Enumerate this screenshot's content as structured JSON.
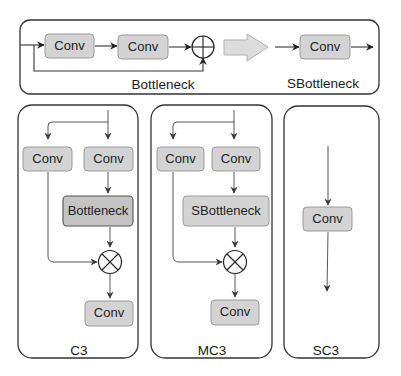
{
  "diagram": {
    "top_panel": {
      "bottleneck": {
        "label": "Bottleneck",
        "conv1": "Conv",
        "conv2": "Conv",
        "add_op": "plus-circle"
      },
      "transform_arrow": "hollow-right-arrow",
      "sbottleneck": {
        "label": "SBottleneck",
        "conv": "Conv"
      }
    },
    "panels": [
      {
        "id": "c3",
        "caption": "C3",
        "left_conv": "Conv",
        "right_conv": "Conv",
        "block": "Bottleneck",
        "merge_op": "times-circle",
        "out_conv": "Conv"
      },
      {
        "id": "mc3",
        "caption": "MC3",
        "left_conv": "Conv",
        "right_conv": "Conv",
        "block": "SBottleneck",
        "merge_op": "times-circle",
        "out_conv": "Conv"
      },
      {
        "id": "sc3",
        "caption": "SC3",
        "conv": "Conv"
      }
    ],
    "colors": {
      "box_fill": "#d3d3d3",
      "box_stroke": "#9a9a9a",
      "block_fill": "#c4c4c4",
      "line": "#333333",
      "hollow_arrow_fill": "#dcdcdc"
    }
  }
}
